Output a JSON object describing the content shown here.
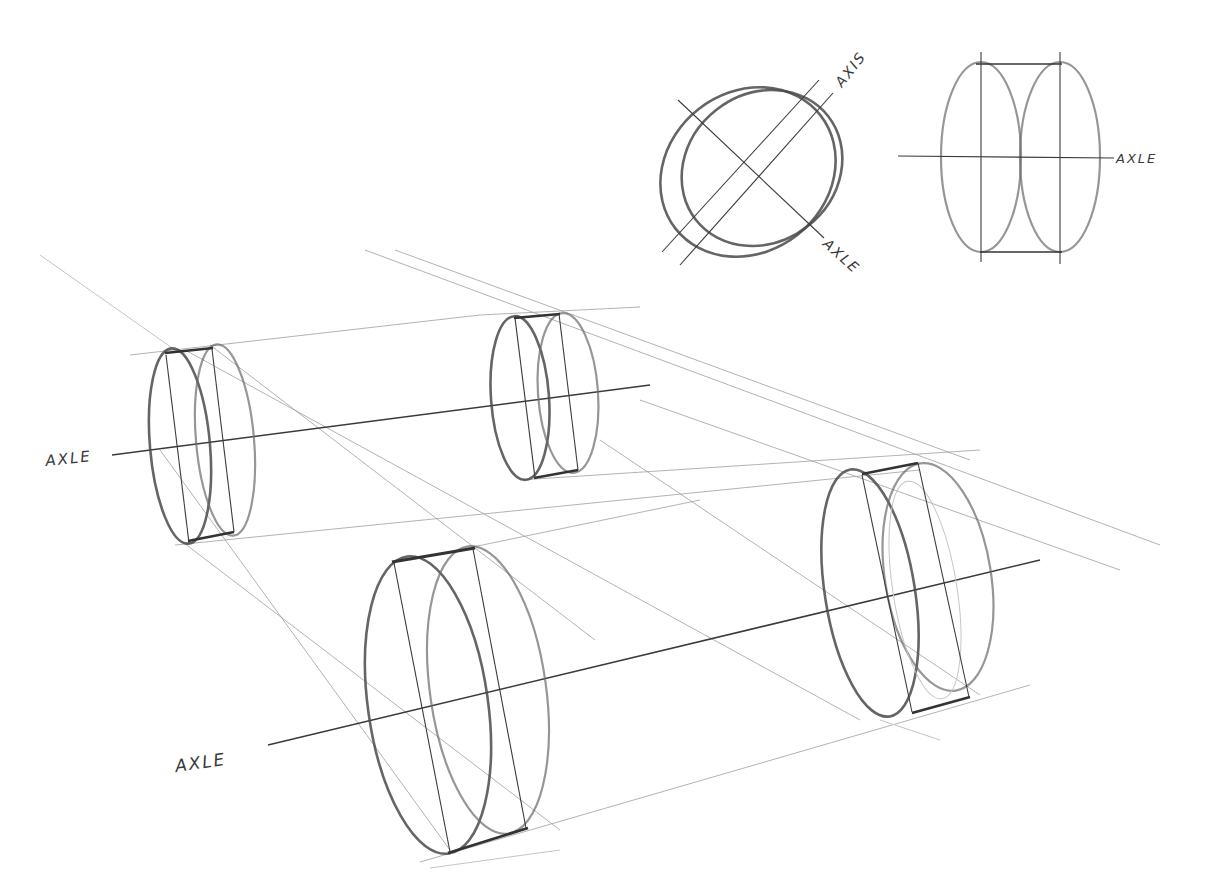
{
  "diagram": {
    "type": "perspective sketch",
    "labels": {
      "top_left_axis": "AXIS",
      "top_left_axle": "AXLE",
      "top_right_axle": "AXLE",
      "left_axle": "AXLE",
      "bottom_axle": "AXLE"
    },
    "colors": {
      "paper": "#ffffff",
      "pencil_dark": "#333333",
      "pencil_mid": "#6a6a6a",
      "pencil_light": "#c4c4c4"
    },
    "figures": [
      {
        "id": "tilted-disc",
        "description": "tilted wheel ellipse pair with axis and axle lines"
      },
      {
        "id": "side-cylinder",
        "description": "front-view cylinder made of two vertical ellipses on a horizontal axle"
      },
      {
        "id": "wheel-rear-left",
        "description": "small rear-left wheel cylinder"
      },
      {
        "id": "wheel-rear-right",
        "description": "small rear-right wheel cylinder"
      },
      {
        "id": "wheel-front-left",
        "description": "large front-left wheel cylinder"
      },
      {
        "id": "wheel-front-right",
        "description": "large front-right wheel cylinder"
      }
    ]
  }
}
